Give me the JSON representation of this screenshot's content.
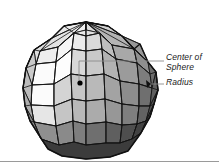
{
  "figure": {
    "kind": "technical-illustration",
    "background_color": "#ffffff",
    "outline_color": "#111111",
    "bottom_rule_color": "#9a9a9a"
  },
  "callouts": [
    {
      "id": "center-of-sphere",
      "line1": "Center of",
      "line2": "Sphere",
      "full_text": "Center of Sphere",
      "leader": "elbow-bracket",
      "target": "center-dot"
    },
    {
      "id": "radius",
      "line1": "Radius",
      "line2": "",
      "full_text": "Radius",
      "leader": "straight",
      "target": "sphere-edge"
    }
  ],
  "center_dot": {
    "cx": 80,
    "cy": 83,
    "r": 2.6,
    "color": "#000000"
  },
  "leader_lines": {
    "color": "#888888",
    "width": 0.9,
    "center_path": "M 164 61 L 79 61 L 79 82",
    "radius_path": "M 164 84 L 152 84"
  },
  "sphere": {
    "cx": 86,
    "cy": 86,
    "rx": 72,
    "ry": 78,
    "meridians": 12,
    "latitudes": 7,
    "shading_note": "light from upper-left; facets darken toward right and bottom",
    "facet_colors": [
      "#f4f4f4",
      "#e2e2e2",
      "#d2d2d2",
      "#c2c2c2",
      "#b0b0b0",
      "#9d9d9d",
      "#8a8a8a",
      "#777777",
      "#646464",
      "#525252",
      "#454545",
      "#3a3a3a"
    ]
  }
}
